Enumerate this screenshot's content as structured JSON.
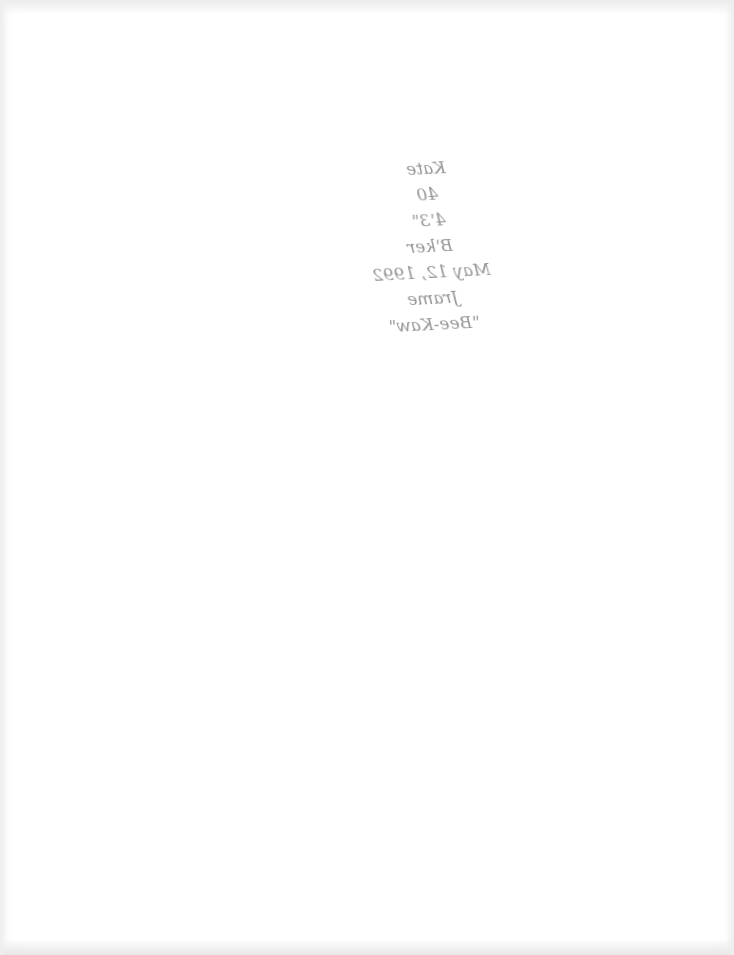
{
  "document": {
    "type": "scanned page (back side, bleed-through handwriting)",
    "handwritten_note": {
      "lines": [
        "Kate",
        "40",
        "4'3\"",
        "B'ker",
        "May 12, 1992",
        "Jrame",
        "\"Bee-Kaw\""
      ]
    },
    "colors": {
      "paper": "#ffffff",
      "ink": "#3c3c3c"
    }
  }
}
